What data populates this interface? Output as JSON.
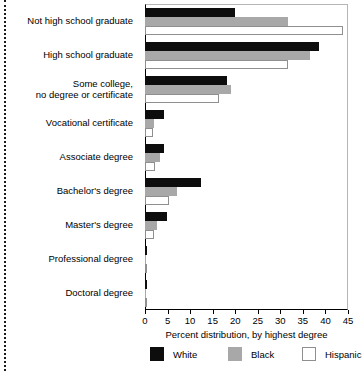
{
  "chart_data": {
    "type": "bar",
    "orientation": "horizontal",
    "title": "",
    "xlabel": "Percent distribution, by highest degree",
    "ylabel": "",
    "xlim": [
      0,
      45
    ],
    "xticks": [
      0,
      5,
      10,
      15,
      20,
      25,
      30,
      35,
      40,
      45
    ],
    "xtick_labels": [
      "0",
      "5",
      "10",
      "15",
      "20",
      "25",
      "30",
      "35",
      "40",
      "45"
    ],
    "grid": false,
    "legend_position": "bottom",
    "categories": [
      "Not high school graduate",
      "High school graduate",
      "Some college,\nno degree or certificate",
      "Vocational certificate",
      "Associate degree",
      "Bachelor's degree",
      "Master's degree",
      "Professional degree",
      "Doctoral degree"
    ],
    "series": [
      {
        "name": "White",
        "color": "#0d0d0d",
        "values": [
          20.0,
          38.6,
          18.2,
          4.2,
          4.2,
          12.4,
          4.9,
          0.5,
          0.5
        ]
      },
      {
        "name": "Black",
        "color": "#a8a8a8",
        "values": [
          31.7,
          36.6,
          19.1,
          2.0,
          3.3,
          7.2,
          2.6,
          0.2,
          0.2
        ]
      },
      {
        "name": "Hispanic",
        "color": "#ffffff",
        "values": [
          44.0,
          31.7,
          16.4,
          1.7,
          2.3,
          5.3,
          1.9,
          0.2,
          0.2
        ]
      }
    ]
  },
  "legend": {
    "items": [
      {
        "label": "White"
      },
      {
        "label": "Black"
      },
      {
        "label": "Hispanic"
      }
    ]
  }
}
